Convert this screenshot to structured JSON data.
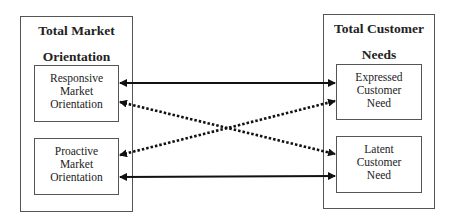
{
  "left": {
    "title_line1": "Total Market",
    "title_line2": "Orientation",
    "boxes": [
      {
        "lines": [
          "Responsive",
          "Market",
          "Orientation"
        ]
      },
      {
        "lines": [
          "Proactive",
          "Market",
          "Orientation"
        ]
      }
    ]
  },
  "right": {
    "title_line1": "Total Customer",
    "title_line2": "Needs",
    "boxes": [
      {
        "lines": [
          "Expressed",
          "Customer",
          "Need"
        ]
      },
      {
        "lines": [
          "Latent",
          "Customer",
          "Need"
        ]
      }
    ]
  },
  "arrows": [
    {
      "style": "solid",
      "from": "Responsive Market Orientation",
      "to": "Expressed Customer Need",
      "bidirectional": true
    },
    {
      "style": "dotted",
      "from": "Responsive Market Orientation",
      "to": "Latent Customer Need",
      "bidirectional": true
    },
    {
      "style": "dotted",
      "from": "Proactive Market Orientation",
      "to": "Expressed Customer Need",
      "bidirectional": true
    },
    {
      "style": "solid",
      "from": "Proactive Market Orientation",
      "to": "Latent Customer Need",
      "bidirectional": true
    }
  ]
}
